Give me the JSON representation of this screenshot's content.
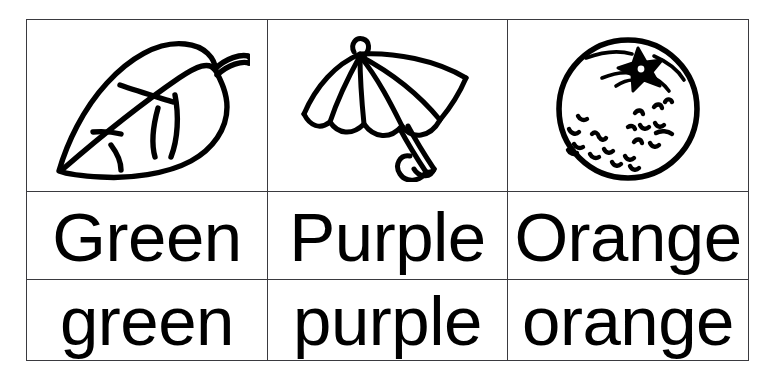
{
  "page": {
    "background_color": "#ffffff",
    "ink_color": "#000000",
    "border_color": "#3a3a3f",
    "columns": 3,
    "rows": 3
  },
  "grid": {
    "row_labels": [
      "picture",
      "uppercase-word",
      "lowercase-word"
    ],
    "columns": [
      {
        "id": "green",
        "picture": {
          "icon_name": "leaf-icon",
          "description": "leaf"
        },
        "word_capitalized": "Green",
        "word_lowercase": "green"
      },
      {
        "id": "purple",
        "picture": {
          "icon_name": "umbrella-icon",
          "description": "umbrella"
        },
        "word_capitalized": "Purple",
        "word_lowercase": "purple"
      },
      {
        "id": "orange",
        "picture": {
          "icon_name": "orange-fruit-icon",
          "description": "orange"
        },
        "word_capitalized": "Orange",
        "word_lowercase": "orange"
      }
    ]
  }
}
